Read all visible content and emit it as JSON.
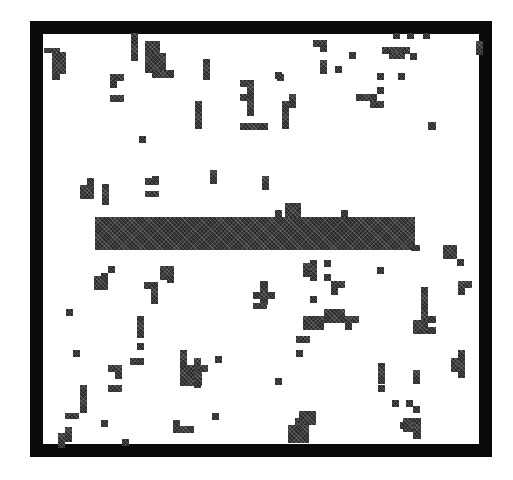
{
  "figure": {
    "width": 513,
    "height": 480,
    "colors": {
      "background": "#ffffff",
      "frame": "#0a0a0a",
      "cell": "#2a2a2a",
      "bar": "#2a2a2a"
    },
    "frame": {
      "x": 30,
      "y": 21,
      "w": 462,
      "h": 436,
      "thickness": 13
    },
    "cell_size": 7,
    "bar": {
      "x": 95,
      "y": 217,
      "w": 320,
      "h": 33
    },
    "bar_bumps": [
      {
        "x": 275,
        "y": 210,
        "w": 7,
        "h": 8
      },
      {
        "x": 285,
        "y": 203,
        "w": 16,
        "h": 15
      },
      {
        "x": 341,
        "y": 210,
        "w": 7,
        "h": 8
      },
      {
        "x": 411,
        "y": 245,
        "w": 9,
        "h": 6
      }
    ],
    "cells": [
      {
        "x": 44,
        "y": 48,
        "w": 16,
        "h": 5
      },
      {
        "x": 52,
        "y": 52,
        "w": 14,
        "h": 22
      },
      {
        "x": 52,
        "y": 72,
        "w": 8,
        "h": 8
      },
      {
        "x": 131,
        "y": 33,
        "w": 7,
        "h": 28
      },
      {
        "x": 145,
        "y": 41,
        "w": 15,
        "h": 14
      },
      {
        "x": 145,
        "y": 53,
        "w": 21,
        "h": 20
      },
      {
        "x": 152,
        "y": 70,
        "w": 22,
        "h": 8
      },
      {
        "x": 203,
        "y": 59,
        "w": 7,
        "h": 21
      },
      {
        "x": 110,
        "y": 74,
        "w": 14,
        "h": 7
      },
      {
        "x": 110,
        "y": 80,
        "w": 7,
        "h": 8
      },
      {
        "x": 110,
        "y": 95,
        "w": 14,
        "h": 7
      },
      {
        "x": 195,
        "y": 101,
        "w": 7,
        "h": 28
      },
      {
        "x": 240,
        "y": 80,
        "w": 14,
        "h": 7
      },
      {
        "x": 240,
        "y": 94,
        "w": 14,
        "h": 7
      },
      {
        "x": 247,
        "y": 80,
        "w": 7,
        "h": 36
      },
      {
        "x": 240,
        "y": 123,
        "w": 28,
        "h": 7
      },
      {
        "x": 282,
        "y": 101,
        "w": 7,
        "h": 28
      },
      {
        "x": 289,
        "y": 94,
        "w": 7,
        "h": 14
      },
      {
        "x": 275,
        "y": 72,
        "w": 7,
        "h": 7
      },
      {
        "x": 313,
        "y": 40,
        "w": 14,
        "h": 7
      },
      {
        "x": 320,
        "y": 44,
        "w": 7,
        "h": 8
      },
      {
        "x": 320,
        "y": 60,
        "w": 7,
        "h": 14
      },
      {
        "x": 335,
        "y": 66,
        "w": 7,
        "h": 7
      },
      {
        "x": 349,
        "y": 52,
        "w": 7,
        "h": 7
      },
      {
        "x": 277,
        "y": 74,
        "w": 7,
        "h": 7
      },
      {
        "x": 382,
        "y": 47,
        "w": 28,
        "h": 7
      },
      {
        "x": 389,
        "y": 52,
        "w": 16,
        "h": 7
      },
      {
        "x": 410,
        "y": 53,
        "w": 7,
        "h": 7
      },
      {
        "x": 393,
        "y": 33,
        "w": 7,
        "h": 6
      },
      {
        "x": 407,
        "y": 33,
        "w": 7,
        "h": 6
      },
      {
        "x": 423,
        "y": 33,
        "w": 7,
        "h": 6
      },
      {
        "x": 476,
        "y": 41,
        "w": 7,
        "h": 14
      },
      {
        "x": 377,
        "y": 73,
        "w": 7,
        "h": 7
      },
      {
        "x": 398,
        "y": 73,
        "w": 7,
        "h": 7
      },
      {
        "x": 377,
        "y": 87,
        "w": 7,
        "h": 7
      },
      {
        "x": 356,
        "y": 94,
        "w": 21,
        "h": 7
      },
      {
        "x": 370,
        "y": 101,
        "w": 14,
        "h": 7
      },
      {
        "x": 428,
        "y": 122,
        "w": 8,
        "h": 8
      },
      {
        "x": 139,
        "y": 136,
        "w": 7,
        "h": 7
      },
      {
        "x": 80,
        "y": 185,
        "w": 14,
        "h": 14
      },
      {
        "x": 87,
        "y": 178,
        "w": 7,
        "h": 8
      },
      {
        "x": 102,
        "y": 184,
        "w": 7,
        "h": 21
      },
      {
        "x": 145,
        "y": 178,
        "w": 14,
        "h": 7
      },
      {
        "x": 152,
        "y": 179,
        "w": 7,
        "h": 0
      },
      {
        "x": 152,
        "y": 176,
        "w": 7,
        "h": 7
      },
      {
        "x": 145,
        "y": 191,
        "w": 14,
        "h": 6
      },
      {
        "x": 210,
        "y": 170,
        "w": 7,
        "h": 14
      },
      {
        "x": 262,
        "y": 176,
        "w": 7,
        "h": 14
      },
      {
        "x": 94,
        "y": 276,
        "w": 14,
        "h": 14
      },
      {
        "x": 101,
        "y": 273,
        "w": 7,
        "h": 7
      },
      {
        "x": 108,
        "y": 266,
        "w": 7,
        "h": 7
      },
      {
        "x": 160,
        "y": 266,
        "w": 14,
        "h": 14
      },
      {
        "x": 167,
        "y": 276,
        "w": 7,
        "h": 7
      },
      {
        "x": 144,
        "y": 282,
        "w": 14,
        "h": 7
      },
      {
        "x": 151,
        "y": 282,
        "w": 7,
        "h": 22
      },
      {
        "x": 66,
        "y": 309,
        "w": 7,
        "h": 7
      },
      {
        "x": 137,
        "y": 316,
        "w": 7,
        "h": 22
      },
      {
        "x": 137,
        "y": 343,
        "w": 7,
        "h": 7
      },
      {
        "x": 73,
        "y": 350,
        "w": 7,
        "h": 7
      },
      {
        "x": 108,
        "y": 365,
        "w": 14,
        "h": 7
      },
      {
        "x": 115,
        "y": 365,
        "w": 7,
        "h": 14
      },
      {
        "x": 130,
        "y": 358,
        "w": 14,
        "h": 7
      },
      {
        "x": 137,
        "y": 358,
        "w": 7,
        "h": 7
      },
      {
        "x": 108,
        "y": 385,
        "w": 14,
        "h": 7
      },
      {
        "x": 80,
        "y": 385,
        "w": 7,
        "h": 28
      },
      {
        "x": 65,
        "y": 413,
        "w": 14,
        "h": 6
      },
      {
        "x": 101,
        "y": 420,
        "w": 7,
        "h": 7
      },
      {
        "x": 65,
        "y": 427,
        "w": 7,
        "h": 15
      },
      {
        "x": 58,
        "y": 433,
        "w": 7,
        "h": 15
      },
      {
        "x": 122,
        "y": 439,
        "w": 7,
        "h": 7
      },
      {
        "x": 180,
        "y": 350,
        "w": 7,
        "h": 36
      },
      {
        "x": 180,
        "y": 365,
        "w": 22,
        "h": 21
      },
      {
        "x": 194,
        "y": 358,
        "w": 7,
        "h": 30
      },
      {
        "x": 194,
        "y": 365,
        "w": 14,
        "h": 7
      },
      {
        "x": 215,
        "y": 356,
        "w": 7,
        "h": 7
      },
      {
        "x": 212,
        "y": 413,
        "w": 7,
        "h": 7
      },
      {
        "x": 173,
        "y": 420,
        "w": 7,
        "h": 8
      },
      {
        "x": 173,
        "y": 426,
        "w": 21,
        "h": 7
      },
      {
        "x": 260,
        "y": 281,
        "w": 8,
        "h": 24
      },
      {
        "x": 253,
        "y": 292,
        "w": 22,
        "h": 7
      },
      {
        "x": 253,
        "y": 303,
        "w": 14,
        "h": 6
      },
      {
        "x": 303,
        "y": 263,
        "w": 7,
        "h": 14
      },
      {
        "x": 310,
        "y": 260,
        "w": 7,
        "h": 21
      },
      {
        "x": 324,
        "y": 260,
        "w": 7,
        "h": 7
      },
      {
        "x": 324,
        "y": 274,
        "w": 7,
        "h": 7
      },
      {
        "x": 331,
        "y": 281,
        "w": 7,
        "h": 14
      },
      {
        "x": 331,
        "y": 281,
        "w": 14,
        "h": 7
      },
      {
        "x": 310,
        "y": 296,
        "w": 7,
        "h": 7
      },
      {
        "x": 377,
        "y": 267,
        "w": 7,
        "h": 7
      },
      {
        "x": 303,
        "y": 316,
        "w": 21,
        "h": 14
      },
      {
        "x": 324,
        "y": 309,
        "w": 21,
        "h": 14
      },
      {
        "x": 345,
        "y": 316,
        "w": 14,
        "h": 7
      },
      {
        "x": 345,
        "y": 316,
        "w": 7,
        "h": 14
      },
      {
        "x": 296,
        "y": 336,
        "w": 14,
        "h": 7
      },
      {
        "x": 296,
        "y": 350,
        "w": 7,
        "h": 7
      },
      {
        "x": 275,
        "y": 378,
        "w": 7,
        "h": 7
      },
      {
        "x": 443,
        "y": 245,
        "w": 14,
        "h": 14
      },
      {
        "x": 457,
        "y": 259,
        "w": 7,
        "h": 7
      },
      {
        "x": 458,
        "y": 281,
        "w": 14,
        "h": 7
      },
      {
        "x": 458,
        "y": 281,
        "w": 7,
        "h": 14
      },
      {
        "x": 421,
        "y": 287,
        "w": 7,
        "h": 40
      },
      {
        "x": 413,
        "y": 320,
        "w": 14,
        "h": 14
      },
      {
        "x": 427,
        "y": 316,
        "w": 9,
        "h": 7
      },
      {
        "x": 427,
        "y": 327,
        "w": 9,
        "h": 7
      },
      {
        "x": 451,
        "y": 358,
        "w": 14,
        "h": 14
      },
      {
        "x": 458,
        "y": 350,
        "w": 7,
        "h": 28
      },
      {
        "x": 378,
        "y": 363,
        "w": 7,
        "h": 21
      },
      {
        "x": 378,
        "y": 385,
        "w": 7,
        "h": 7
      },
      {
        "x": 413,
        "y": 370,
        "w": 7,
        "h": 14
      },
      {
        "x": 392,
        "y": 400,
        "w": 7,
        "h": 7
      },
      {
        "x": 406,
        "y": 400,
        "w": 7,
        "h": 7
      },
      {
        "x": 413,
        "y": 406,
        "w": 7,
        "h": 7
      },
      {
        "x": 400,
        "y": 422,
        "w": 21,
        "h": 7
      },
      {
        "x": 403,
        "y": 418,
        "w": 18,
        "h": 14
      },
      {
        "x": 413,
        "y": 418,
        "w": 8,
        "h": 21
      },
      {
        "x": 295,
        "y": 418,
        "w": 14,
        "h": 25
      },
      {
        "x": 299,
        "y": 411,
        "w": 17,
        "h": 14
      },
      {
        "x": 288,
        "y": 425,
        "w": 21,
        "h": 18
      }
    ]
  }
}
